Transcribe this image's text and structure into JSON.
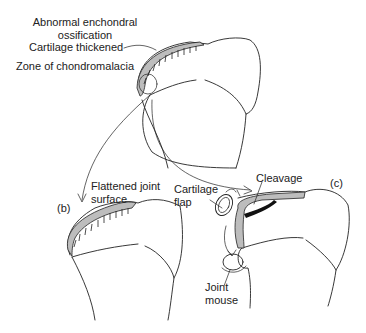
{
  "figure": {
    "panels": [
      {
        "id": "a",
        "label": "",
        "description": "Femoral condyle with early lesion"
      },
      {
        "id": "b",
        "label": "(b)",
        "description": "Flattened joint surface"
      },
      {
        "id": "c",
        "label": "(c)",
        "description": "Cartilage flap cleavage and joint mouse"
      }
    ],
    "labels": {
      "abnormal_ossification_line1": "Abnormal enchondral",
      "abnormal_ossification_line2": "ossification",
      "cartilage_thickened": "Cartilage thickened",
      "chondromalacia": "Zone of chondromalacia",
      "flattened_line1": "Flattened joint",
      "flattened_line2": "surface",
      "cartilage_flap_line1": "Cartilage",
      "cartilage_flap_line2": "flap",
      "cleavage": "Cleavage",
      "joint_mouse_line1": "Joint",
      "joint_mouse_line2": "mouse",
      "panel_b": "(b)",
      "panel_c": "(c)"
    },
    "colors": {
      "ink": "#222222",
      "cartilage_fill": "#bdbdbd",
      "background": "#ffffff"
    }
  }
}
